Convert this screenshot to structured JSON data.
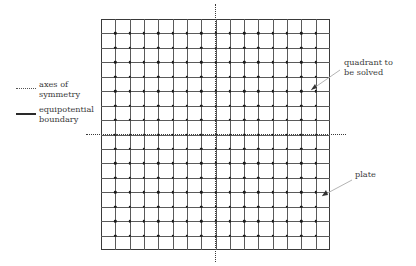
{
  "diagram": {
    "legend": {
      "items": [
        {
          "key": "dotted-line-icon",
          "line_style": "dotted",
          "label_line1": "axes of",
          "label_line2": "symmetry",
          "color": "#555555"
        },
        {
          "key": "solid-line-icon",
          "line_style": "solid",
          "label_line1": "equipotential",
          "label_line2": "boundary",
          "color": "#2a2a2a"
        }
      ]
    },
    "annotations": [
      {
        "name": "quadrant-to-be-solved",
        "line1": "quadrant to",
        "line2": "be solved"
      },
      {
        "name": "plate",
        "line1": "plate",
        "line2": ""
      }
    ],
    "plate": {
      "shape": "square",
      "boundary_type": "equipotential boundary",
      "boundary_color": "#3a3a3a"
    },
    "grid": {
      "columns": 16,
      "rows": 16,
      "line_color": "#5a5a5a",
      "node_color": "#1a1a1a"
    },
    "quadrant": {
      "position": "upper-right",
      "shade_color": "#ececec",
      "status": "to be solved"
    },
    "axes": {
      "vertical_label": "axis of symmetry",
      "horizontal_label": "axis of symmetry",
      "style": "dotted",
      "color": "#3a3a3a"
    }
  }
}
